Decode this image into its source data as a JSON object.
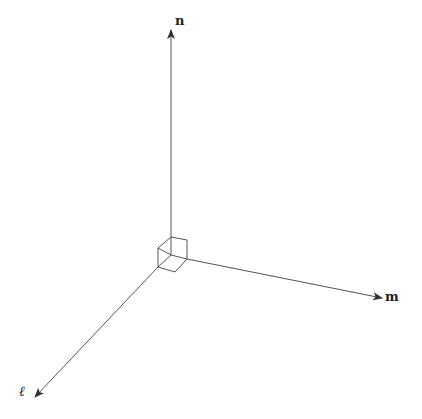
{
  "diagram": {
    "type": "3d-coordinate-axes",
    "stroke_color": "#555555",
    "label_color": "#222222",
    "axes": [
      {
        "id": "n",
        "label": "n",
        "direction": "up"
      },
      {
        "id": "m",
        "label": "m",
        "direction": "right-down"
      },
      {
        "id": "l",
        "label": "ℓ",
        "direction": "left-down"
      }
    ],
    "origin_marker": "unit-cube"
  }
}
